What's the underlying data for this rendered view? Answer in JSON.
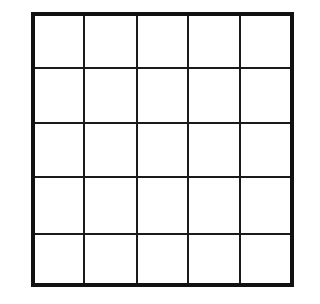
{
  "grid": {
    "rows": 5,
    "cols": 5,
    "border_color": "#111111",
    "line_color": "#1a1a1a",
    "background": "#ffffff"
  }
}
